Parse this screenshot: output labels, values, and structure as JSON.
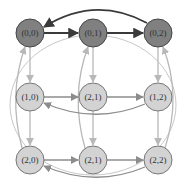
{
  "colors": {
    "dark_node_fill": "#808080",
    "light_node_fill": "#d3d3d3",
    "node_stroke": "#555555",
    "dark_edge": "#3a3a3a",
    "light_edge": "#b0b0b0",
    "mid_edge": "#8c8c8c"
  },
  "nodes": [
    {
      "id": "n00",
      "label": "(0,0)",
      "x": 30,
      "y": 33,
      "style": "dark"
    },
    {
      "id": "n01",
      "label": "(0,1)",
      "x": 93,
      "y": 33,
      "style": "dark"
    },
    {
      "id": "n02",
      "label": "(0,2)",
      "x": 158,
      "y": 33,
      "style": "dark"
    },
    {
      "id": "n10",
      "label": "(1,0)",
      "x": 30,
      "y": 97,
      "style": "light"
    },
    {
      "id": "n11",
      "label": "(2,1)",
      "x": 93,
      "y": 97,
      "style": "light"
    },
    {
      "id": "n12",
      "label": "(1,2)",
      "x": 158,
      "y": 97,
      "style": "light"
    },
    {
      "id": "n20",
      "label": "(2,0)",
      "x": 30,
      "y": 160,
      "style": "light"
    },
    {
      "id": "n21",
      "label": "(2,1)",
      "x": 93,
      "y": 160,
      "style": "light"
    },
    {
      "id": "n22",
      "label": "(2,2)",
      "x": 158,
      "y": 160,
      "style": "light"
    }
  ],
  "edges": [
    {
      "from": "(0,0)",
      "to": "(0,1)",
      "style": "dark"
    },
    {
      "from": "(0,1)",
      "to": "(0,2)",
      "style": "dark"
    },
    {
      "from": "(0,2)",
      "to": "(0,0)",
      "style": "dark",
      "curved": true
    },
    {
      "from": "(1,0)",
      "to": "(2,1)",
      "style": "mid"
    },
    {
      "from": "(2,1)",
      "to": "(1,2)",
      "style": "mid"
    },
    {
      "from": "(1,2)",
      "to": "(1,0)",
      "style": "mid",
      "curved": true
    },
    {
      "from": "(2,0)",
      "to": "(2,1)",
      "style": "mid"
    },
    {
      "from": "(2,1)",
      "to": "(2,2)",
      "style": "mid"
    },
    {
      "from": "(2,2)",
      "to": "(2,0)",
      "style": "mid",
      "curved": true
    },
    {
      "from": "(0,0)",
      "to": "(1,0)",
      "style": "light"
    },
    {
      "from": "(1,0)",
      "to": "(2,0)",
      "style": "light"
    },
    {
      "from": "(2,0)",
      "to": "(0,0)",
      "style": "light",
      "curved": true
    },
    {
      "from": "(0,1)",
      "to": "(2,1)",
      "style": "light"
    },
    {
      "from": "(2,1)",
      "to": "(2,1)",
      "style": "light"
    },
    {
      "from": "(2,1)",
      "to": "(0,1)",
      "style": "light",
      "curved": true
    },
    {
      "from": "(0,2)",
      "to": "(1,2)",
      "style": "light"
    },
    {
      "from": "(1,2)",
      "to": "(2,2)",
      "style": "light"
    },
    {
      "from": "(2,2)",
      "to": "(0,2)",
      "style": "light",
      "curved": true
    }
  ]
}
